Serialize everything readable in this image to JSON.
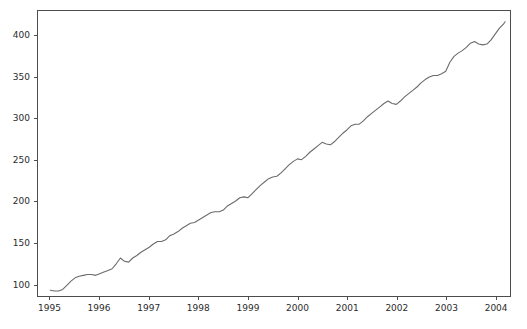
{
  "chart_data": {
    "type": "line",
    "title": "",
    "subtitle": "",
    "xlabel": "",
    "ylabel": "",
    "xlim": [
      1994.75,
      2004.3
    ],
    "ylim": [
      85,
      430
    ],
    "grid": false,
    "legend": null,
    "legend_position": "none",
    "line_color": "#6b6b6b",
    "line_width": 1.1,
    "background_color": "#ffffff",
    "axes_edge_color": "#4d4d4d",
    "tick_color": "#2b2b2b",
    "x_tick_labels": [
      "1995",
      "1996",
      "1997",
      "1998",
      "1999",
      "2000",
      "2001",
      "2002",
      "2003",
      "2004"
    ],
    "x_ticks": [
      1995,
      1996,
      1997,
      1998,
      1999,
      2000,
      2001,
      2002,
      2003,
      2004
    ],
    "y_tick_labels": [
      "100",
      "150",
      "200",
      "250",
      "300",
      "350",
      "400"
    ],
    "y_ticks": [
      100,
      150,
      200,
      250,
      300,
      350,
      400
    ],
    "series": [
      {
        "name": "series-1",
        "color": "#6b6b6b",
        "x": [
          1995.0,
          1995.083,
          1995.167,
          1995.25,
          1995.333,
          1995.417,
          1995.5,
          1995.583,
          1995.667,
          1995.75,
          1995.833,
          1995.917,
          1996.0,
          1996.083,
          1996.167,
          1996.25,
          1996.333,
          1996.417,
          1996.5,
          1996.583,
          1996.667,
          1996.75,
          1996.833,
          1996.917,
          1997.0,
          1997.083,
          1997.167,
          1997.25,
          1997.333,
          1997.417,
          1997.5,
          1997.583,
          1997.667,
          1997.75,
          1997.833,
          1997.917,
          1998.0,
          1998.083,
          1998.167,
          1998.25,
          1998.333,
          1998.417,
          1998.5,
          1998.583,
          1998.667,
          1998.75,
          1998.833,
          1998.917,
          1999.0,
          1999.083,
          1999.167,
          1999.25,
          1999.333,
          1999.417,
          1999.5,
          1999.583,
          1999.667,
          1999.75,
          1999.833,
          1999.917,
          2000.0,
          2000.083,
          2000.167,
          2000.25,
          2000.333,
          2000.417,
          2000.5,
          2000.583,
          2000.667,
          2000.75,
          2000.833,
          2000.917,
          2001.0,
          2001.083,
          2001.167,
          2001.25,
          2001.333,
          2001.417,
          2001.5,
          2001.583,
          2001.667,
          2001.75,
          2001.833,
          2001.917,
          2002.0,
          2002.083,
          2002.167,
          2002.25,
          2002.333,
          2002.417,
          2002.5,
          2002.583,
          2002.667,
          2002.75,
          2002.833,
          2002.917,
          2003.0,
          2003.083,
          2003.167,
          2003.25,
          2003.333,
          2003.417,
          2003.5,
          2003.583,
          2003.667,
          2003.75,
          2003.833,
          2003.917,
          2004.0
        ],
        "y": [
          92,
          91,
          91,
          93,
          98,
          103,
          107,
          109,
          110,
          111,
          111,
          110,
          112,
          114,
          116,
          118,
          124,
          131,
          127,
          126,
          131,
          134,
          138,
          141,
          144,
          148,
          151,
          151,
          153,
          158,
          160,
          163,
          167,
          170,
          173,
          174,
          177,
          180,
          183,
          186,
          187,
          187,
          189,
          194,
          197,
          200,
          204,
          205,
          204,
          209,
          214,
          219,
          223,
          227,
          229,
          230,
          234,
          239,
          244,
          248,
          251,
          250,
          254,
          259,
          263,
          267,
          271,
          269,
          268,
          272,
          277,
          282,
          286,
          291,
          293,
          293,
          297,
          302,
          306,
          310,
          314,
          318,
          321,
          318,
          317,
          321,
          326,
          330,
          334,
          338,
          343,
          347,
          350,
          352,
          352,
          354,
          357,
          368,
          375,
          379,
          382,
          386,
          391,
          393,
          390,
          389,
          390,
          395,
          402
        ]
      }
    ],
    "series_extra": {
      "tail_x": [
        2003.917,
        2004.0,
        2004.083,
        2004.167,
        2004.2
      ],
      "tail_y": [
        395,
        402,
        409,
        414,
        417
      ]
    },
    "value_range": {
      "min": 91,
      "max": 422,
      "start_value": 92,
      "end_value": 419
    }
  }
}
